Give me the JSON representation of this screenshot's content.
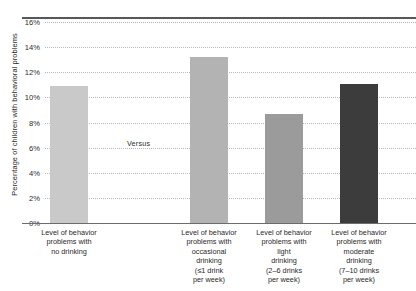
{
  "chart_data": {
    "type": "bar",
    "title": "",
    "xlabel": "",
    "ylabel": "Percentage of children with behavioral problems",
    "ylim": [
      0,
      16
    ],
    "ytick_labels": [
      "0%",
      "2%",
      "4%",
      "6%",
      "8%",
      "10%",
      "12%",
      "14%",
      "16%"
    ],
    "ytick_values": [
      0,
      2,
      4,
      6,
      8,
      10,
      12,
      14,
      16
    ],
    "grid": true,
    "legend": "none",
    "annotations": [
      {
        "text": "Versus",
        "between": [
          0,
          1
        ]
      }
    ],
    "categories": [
      "Level of behavior problems with no drinking",
      "Level of behavior problems with occasional drinking (≤1 drink per week)",
      "Level of behavior problems with light drinking (2–6 drinks per week)",
      "Level of behavior problems with moderate drinking (7–10 drinks per week)"
    ],
    "category_lines": [
      [
        "Level of behavior",
        "problems with",
        "no drinking"
      ],
      [
        "Level of behavior",
        "problems with",
        "occasional",
        "drinking",
        "(≤1 drink",
        "per week)"
      ],
      [
        "Level of behavior",
        "problems with",
        "light",
        "drinking",
        "(2–6 drinks",
        "per week)"
      ],
      [
        "Level of behavior",
        "problems with",
        "moderate",
        "drinking",
        "(7–10 drinks",
        "per week)"
      ]
    ],
    "values": [
      10.9,
      13.2,
      8.7,
      11.1
    ],
    "bar_colors": [
      "#c9c9c9",
      "#b3b3b3",
      "#9b9b9b",
      "#3c3c3c"
    ]
  },
  "colors": {
    "background": "#ffffff",
    "axis": "#6a6d70",
    "gridline": "#b9b9b9",
    "text": "#2a2a2a",
    "top_rule": "#55595c"
  }
}
